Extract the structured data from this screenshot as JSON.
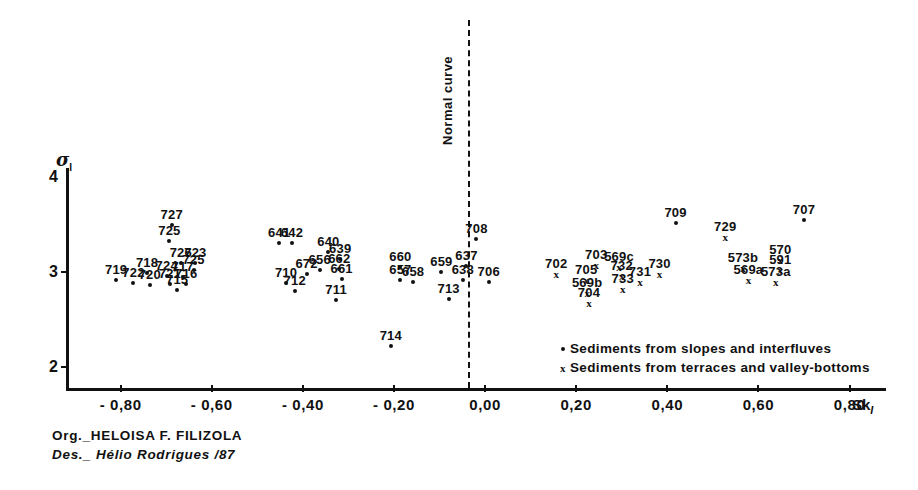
{
  "chart_data": {
    "type": "scatter",
    "title": "",
    "xlabel": "Sk",
    "xlabel_sub": "I",
    "ylabel": "σ",
    "ylabel_sub": "I",
    "xlim": [
      -0.92,
      0.88
    ],
    "ylim": [
      1.78,
      4.1
    ],
    "xticks": [
      "- 0,80",
      "- 0,60",
      "- 0,40",
      "- 0,20",
      "0,00",
      "0,20",
      "0,40",
      "0,60",
      "0,80"
    ],
    "xtick_values": [
      -0.8,
      -0.6,
      -0.4,
      -0.2,
      0.0,
      0.2,
      0.4,
      0.6,
      0.8
    ],
    "yticks": [
      "4",
      "3",
      "2"
    ],
    "ytick_values": [
      4,
      3,
      2
    ],
    "grid": false,
    "legend_position": "bottom-right",
    "annotations": [
      {
        "name": "normal-curve",
        "text": "Normal curve",
        "x": 0.0,
        "orientation": "vertical",
        "style": "dashed"
      }
    ],
    "series": [
      {
        "name": "Sediments from slopes and interfluves",
        "marker": "dot",
        "points": [
          {
            "label": "727",
            "x": -0.688,
            "y": 3.5
          },
          {
            "label": "725",
            "x": -0.693,
            "y": 3.33
          },
          {
            "label": "719",
            "x": -0.81,
            "y": 2.92
          },
          {
            "label": "718",
            "x": -0.742,
            "y": 2.99
          },
          {
            "label": "722",
            "x": -0.772,
            "y": 2.89
          },
          {
            "label": "720",
            "x": -0.736,
            "y": 2.87
          },
          {
            "label": "724",
            "x": -0.699,
            "y": 2.96
          },
          {
            "label": "721",
            "x": -0.692,
            "y": 2.88
          },
          {
            "label": "726",
            "x": -0.668,
            "y": 3.1
          },
          {
            "label": "723",
            "x": -0.636,
            "y": 3.1
          },
          {
            "label": "725b",
            "x": -0.64,
            "y": 3.02
          },
          {
            "label": "717",
            "x": -0.664,
            "y": 2.95
          },
          {
            "label": "716",
            "x": -0.656,
            "y": 2.88
          },
          {
            "label": "715",
            "x": -0.676,
            "y": 2.81
          },
          {
            "label": "641",
            "x": -0.452,
            "y": 3.31
          },
          {
            "label": "642",
            "x": -0.424,
            "y": 3.31
          },
          {
            "label": "710",
            "x": -0.437,
            "y": 2.89
          },
          {
            "label": "712",
            "x": -0.418,
            "y": 2.8
          },
          {
            "label": "672",
            "x": -0.392,
            "y": 2.98
          },
          {
            "label": "656",
            "x": -0.363,
            "y": 3.02
          },
          {
            "label": "640",
            "x": -0.344,
            "y": 3.21
          },
          {
            "label": "639",
            "x": -0.318,
            "y": 3.14
          },
          {
            "label": "662",
            "x": -0.32,
            "y": 3.03
          },
          {
            "label": "661",
            "x": -0.315,
            "y": 2.93
          },
          {
            "label": "711",
            "x": -0.327,
            "y": 2.71
          },
          {
            "label": "714",
            "x": -0.207,
            "y": 2.22
          },
          {
            "label": "660",
            "x": -0.186,
            "y": 3.06
          },
          {
            "label": "657",
            "x": -0.186,
            "y": 2.92
          },
          {
            "label": "658",
            "x": -0.158,
            "y": 2.9
          },
          {
            "label": "659",
            "x": -0.096,
            "y": 3.0
          },
          {
            "label": "713",
            "x": -0.08,
            "y": 2.72
          },
          {
            "label": "637",
            "x": -0.041,
            "y": 3.07
          },
          {
            "label": "638",
            "x": -0.049,
            "y": 2.92
          },
          {
            "label": "708",
            "x": -0.019,
            "y": 3.35
          },
          {
            "label": "706",
            "x": 0.008,
            "y": 2.9
          },
          {
            "label": "709",
            "x": 0.418,
            "y": 3.52
          },
          {
            "label": "707",
            "x": 0.7,
            "y": 3.55
          }
        ]
      },
      {
        "name": "Sediments from terraces and valley-bottoms",
        "marker": "x",
        "points": [
          {
            "label": "702",
            "x": 0.156,
            "y": 2.98
          },
          {
            "label": "705",
            "x": 0.222,
            "y": 2.92
          },
          {
            "label": "569b",
            "x": 0.224,
            "y": 2.78
          },
          {
            "label": "704",
            "x": 0.228,
            "y": 2.68
          },
          {
            "label": "703",
            "x": 0.244,
            "y": 3.08
          },
          {
            "label": "569c",
            "x": 0.294,
            "y": 3.06
          },
          {
            "label": "732",
            "x": 0.3,
            "y": 2.96
          },
          {
            "label": "733",
            "x": 0.302,
            "y": 2.82
          },
          {
            "label": "731",
            "x": 0.34,
            "y": 2.9
          },
          {
            "label": "730",
            "x": 0.383,
            "y": 2.98
          },
          {
            "label": "729",
            "x": 0.527,
            "y": 3.37
          },
          {
            "label": "573b",
            "x": 0.566,
            "y": 3.05
          },
          {
            "label": "569a",
            "x": 0.578,
            "y": 2.92
          },
          {
            "label": "570",
            "x": 0.648,
            "y": 3.13
          },
          {
            "label": "591",
            "x": 0.648,
            "y": 3.02
          },
          {
            "label": "573a",
            "x": 0.638,
            "y": 2.9
          }
        ]
      }
    ]
  },
  "legend": {
    "items": [
      {
        "marker": "dot",
        "label": "Sediments from slopes and interfluves"
      },
      {
        "marker": "x",
        "label": "Sediments from terraces and valley-bottoms"
      }
    ]
  },
  "credits": {
    "org": "Org._HELOISA F. FILIZOLA",
    "des": "Des._ Hélio  Rodrigues /87"
  },
  "colors": {
    "ink": "#111111",
    "background": "#ffffff"
  }
}
